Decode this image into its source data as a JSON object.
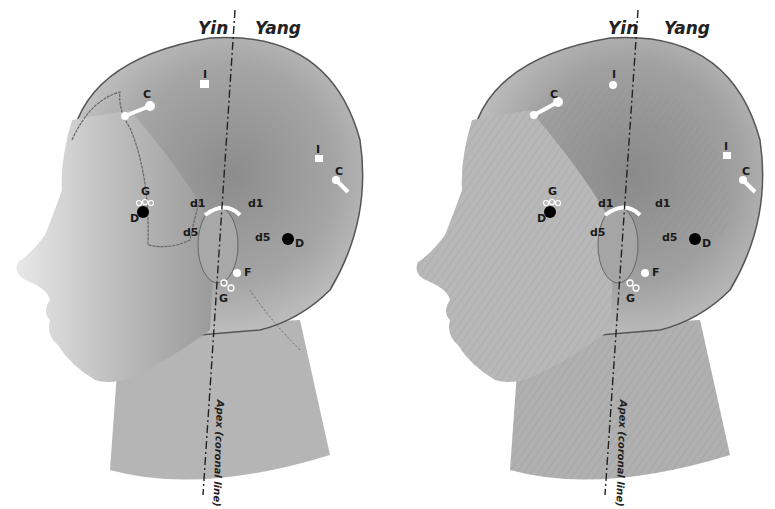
{
  "figure": {
    "panels": [
      {
        "id": "left",
        "style": "skin surface profile",
        "hemisphere_labels": {
          "yin": "Yin",
          "yang": "Yang"
        },
        "axis_label": "Apex (coronal line)",
        "points": {
          "I_top": "I",
          "C_front": "C",
          "I_back": "I",
          "C_back": "C",
          "G_temple": "G",
          "D_temple": "D",
          "d1_front": "d1",
          "d1_back": "d1",
          "d5_front": "d5",
          "d5_back": "d5",
          "D_back": "D",
          "F": "F",
          "G_neck": "G"
        }
      },
      {
        "id": "right",
        "style": "muscular anatomy profile",
        "hemisphere_labels": {
          "yin": "Yin",
          "yang": "Yang"
        },
        "axis_label": "Apex (coronal line)",
        "points": {
          "I_top": "I",
          "C_front": "C",
          "I_back": "I",
          "C_back": "C",
          "G_temple": "G",
          "D_temple": "D",
          "d1_front": "d1",
          "d1_back": "d1",
          "d5_front": "d5",
          "d5_back": "d5",
          "D_back": "D",
          "F": "F",
          "G_neck": "G"
        }
      }
    ],
    "colors": {
      "skin": "#9a9a9a",
      "skin_light": "#d0d0d0",
      "outline": "#555555",
      "marker_dark": "#000000",
      "marker_light": "#ffffff"
    }
  }
}
